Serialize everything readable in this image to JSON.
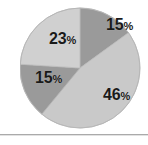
{
  "chart_data": {
    "type": "pie",
    "title": "",
    "subtitle": "",
    "xlabel": "",
    "ylabel": "",
    "legend": "none",
    "grid": false,
    "start_angle_deg": 0,
    "direction": "clockwise",
    "categories": [
      "15%",
      "46%",
      "15%",
      "23%"
    ],
    "values": [
      15,
      46,
      15,
      23
    ],
    "labels": [
      "15%",
      "46%",
      "15%",
      "23%"
    ],
    "slices": [
      {
        "label": "15%",
        "value": 15,
        "number": "15",
        "percent_sign": "%",
        "color": "#9a9a9a",
        "start_deg": 0,
        "end_deg": 54,
        "position": "top-right"
      },
      {
        "label": "46%",
        "value": 46,
        "number": "46",
        "percent_sign": "%",
        "color": "#c9c9c9",
        "start_deg": 54,
        "end_deg": 219.6,
        "position": "bottom-right"
      },
      {
        "label": "15%",
        "value": 15,
        "number": "15",
        "percent_sign": "%",
        "color": "#9a9a9a",
        "start_deg": 219.6,
        "end_deg": 273.6,
        "position": "bottom-left"
      },
      {
        "label": "23%",
        "value": 23,
        "number": "23",
        "percent_sign": "%",
        "color": "#d0d0d0",
        "start_deg": 273.6,
        "end_deg": 360,
        "position": "top-left"
      }
    ],
    "total": 99
  },
  "figure": {
    "background_color": "#ffffff",
    "divider_color": "#aaaaaa",
    "pie_outline_color": "#b4b4b4"
  }
}
